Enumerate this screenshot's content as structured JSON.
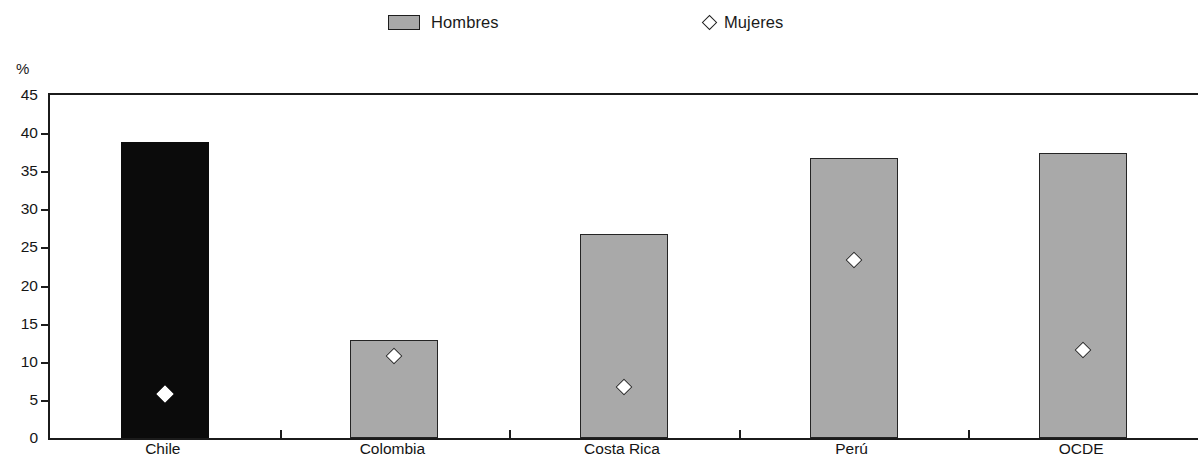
{
  "legend": {
    "entries": [
      {
        "label": "Hombres",
        "marker": "filled-rect-swatch",
        "color": "#a8a8a8"
      },
      {
        "label": "Mujeres",
        "marker": "open-diamond",
        "color": "#ffffff"
      }
    ]
  },
  "axis": {
    "unit_label": "%",
    "y_ticks": [
      "45",
      "40",
      "35",
      "30",
      "25",
      "20",
      "15",
      "10",
      "5",
      "0"
    ]
  },
  "chart_data": {
    "type": "bar",
    "title": "",
    "subtitle": "",
    "xlabel": "",
    "ylabel": "%",
    "ylim": [
      0,
      45
    ],
    "ytick_values": [
      0,
      5,
      10,
      15,
      20,
      25,
      30,
      35,
      40,
      45
    ],
    "grid": false,
    "legend_position": "top-center",
    "categories": [
      "Chile",
      "Colombia",
      "Costa Rica",
      "Perú",
      "OCDE"
    ],
    "series": [
      {
        "name": "Hombres",
        "type": "bar",
        "color": "#a9a9a9",
        "highlight_color": "#0b0b0b",
        "highlight_category": "Chile",
        "values": [
          38.8,
          12.9,
          26.8,
          36.7,
          37.4
        ]
      },
      {
        "name": "Mujeres",
        "type": "scatter",
        "marker": "open-diamond",
        "color": "#ffffff",
        "values": [
          6.6,
          11.6,
          7.5,
          24.1,
          12.4
        ]
      }
    ]
  }
}
